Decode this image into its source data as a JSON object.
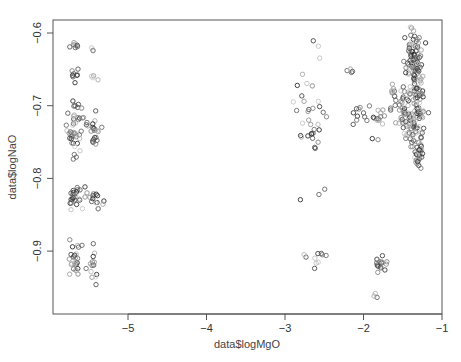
{
  "chart_data": {
    "type": "scatter",
    "title": "",
    "xlabel": "data$logMgO",
    "ylabel": "data$logNaO",
    "xlim": [
      -5.9,
      -1.0
    ],
    "ylim": [
      -0.985,
      -0.581
    ],
    "xticks": [
      -5,
      -4,
      -3,
      -2,
      -1
    ],
    "xtick_labels": [
      "-5",
      "-4",
      "-3",
      "-2",
      "-1"
    ],
    "yticks": [
      -0.6,
      -0.7,
      -0.8,
      -0.9
    ],
    "ytick_labels": [
      "-0.6",
      "-0.7",
      "-0.8",
      "-0.9"
    ],
    "grid": false,
    "legend": null,
    "marker": "open-circle",
    "color_encoding": "grayscale (light to dark)",
    "clusters": [
      {
        "x": -5.68,
        "y": -0.617,
        "n": 8,
        "sx": 0.03,
        "sy": 0.004
      },
      {
        "x": -5.67,
        "y": -0.656,
        "n": 8,
        "sx": 0.03,
        "sy": 0.007
      },
      {
        "x": -5.68,
        "y": -0.73,
        "n": 45,
        "sx": 0.06,
        "sy": 0.018
      },
      {
        "x": -5.68,
        "y": -0.826,
        "n": 25,
        "sx": 0.05,
        "sy": 0.007
      },
      {
        "x": -5.68,
        "y": -0.915,
        "n": 28,
        "sx": 0.04,
        "sy": 0.012
      },
      {
        "x": -5.44,
        "y": -0.62,
        "n": 3,
        "sx": 0.02,
        "sy": 0.004
      },
      {
        "x": -5.44,
        "y": -0.66,
        "n": 4,
        "sx": 0.02,
        "sy": 0.004
      },
      {
        "x": -5.44,
        "y": -0.733,
        "n": 22,
        "sx": 0.04,
        "sy": 0.014
      },
      {
        "x": -5.42,
        "y": -0.828,
        "n": 16,
        "sx": 0.05,
        "sy": 0.008
      },
      {
        "x": -5.44,
        "y": -0.917,
        "n": 14,
        "sx": 0.04,
        "sy": 0.012
      },
      {
        "x": -2.6,
        "y": -0.617,
        "n": 2,
        "sx": 0.05,
        "sy": 0.003
      },
      {
        "x": -2.68,
        "y": -0.69,
        "n": 18,
        "sx": 0.12,
        "sy": 0.02
      },
      {
        "x": -2.68,
        "y": -0.735,
        "n": 12,
        "sx": 0.1,
        "sy": 0.01
      },
      {
        "x": -2.6,
        "y": -0.755,
        "n": 3,
        "sx": 0.04,
        "sy": 0.005
      },
      {
        "x": -2.6,
        "y": -0.82,
        "n": 3,
        "sx": 0.06,
        "sy": 0.006
      },
      {
        "x": -2.6,
        "y": -0.908,
        "n": 10,
        "sx": 0.08,
        "sy": 0.007
      },
      {
        "x": -2.18,
        "y": -0.652,
        "n": 5,
        "sx": 0.03,
        "sy": 0.003
      },
      {
        "x": -2.1,
        "y": -0.71,
        "n": 10,
        "sx": 0.08,
        "sy": 0.006
      },
      {
        "x": -1.85,
        "y": -0.72,
        "n": 16,
        "sx": 0.05,
        "sy": 0.015
      },
      {
        "x": -1.78,
        "y": -0.92,
        "n": 18,
        "sx": 0.04,
        "sy": 0.008
      },
      {
        "x": -1.88,
        "y": -0.962,
        "n": 3,
        "sx": 0.03,
        "sy": 0.005
      },
      {
        "x": -1.62,
        "y": -0.68,
        "n": 8,
        "sx": 0.03,
        "sy": 0.005
      },
      {
        "x": -1.5,
        "y": -0.705,
        "n": 25,
        "sx": 0.1,
        "sy": 0.012
      },
      {
        "x": -1.38,
        "y": -0.63,
        "n": 60,
        "sx": 0.05,
        "sy": 0.018
      },
      {
        "x": -1.32,
        "y": -0.69,
        "n": 90,
        "sx": 0.05,
        "sy": 0.035
      },
      {
        "x": -1.4,
        "y": -0.725,
        "n": 60,
        "sx": 0.07,
        "sy": 0.02
      },
      {
        "x": -1.3,
        "y": -0.765,
        "n": 25,
        "sx": 0.03,
        "sy": 0.01
      },
      {
        "x": -1.2,
        "y": -0.615,
        "n": 1,
        "sx": 0.01,
        "sy": 0.002
      }
    ]
  },
  "axes": {
    "x_label": "data$logMgO",
    "y_label": "data$logNaO",
    "x_ticks": [
      "-5",
      "-4",
      "-3",
      "-2",
      "-1"
    ],
    "y_ticks": [
      "-0.6",
      "-0.7",
      "-0.8",
      "-0.9"
    ]
  },
  "layout": {
    "plot_left": 53,
    "plot_right": 442,
    "plot_top": 20,
    "plot_bottom": 314
  }
}
